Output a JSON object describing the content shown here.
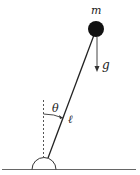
{
  "diagram": {
    "labels": {
      "mass": "m",
      "gravity": "g",
      "angle": "θ",
      "length": "ℓ"
    },
    "colors": {
      "stroke": "#222222",
      "mass_fill": "#111111",
      "dashed": "#555555",
      "ground": "#666666"
    }
  }
}
